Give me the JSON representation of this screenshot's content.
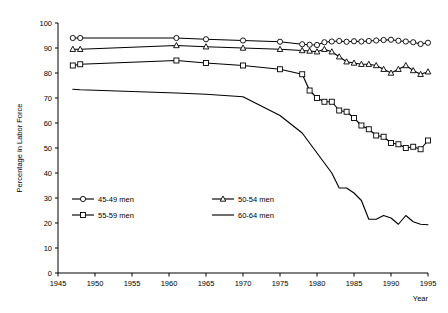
{
  "chart_data": {
    "type": "line",
    "title": "",
    "xlabel": "Year",
    "ylabel": "Percentage in Labor Force",
    "xlim": [
      1945,
      1995
    ],
    "ylim": [
      0,
      100
    ],
    "grid": false,
    "legend_position": "lower-left-inside",
    "xticks": [
      1945,
      1950,
      1955,
      1960,
      1965,
      1970,
      1975,
      1980,
      1985,
      1990,
      1995
    ],
    "yticks": [
      0,
      10,
      20,
      30,
      40,
      50,
      60,
      70,
      80,
      90,
      100
    ],
    "series": [
      {
        "name": "45-49 men",
        "marker": "circle",
        "x": [
          1947,
          1948,
          1961,
          1965,
          1970,
          1975,
          1978,
          1979,
          1980,
          1981,
          1982,
          1983,
          1984,
          1985,
          1986,
          1987,
          1988,
          1989,
          1990,
          1991,
          1992,
          1993,
          1994,
          1995
        ],
        "values": [
          94,
          94,
          94,
          93.5,
          93,
          92.5,
          91.5,
          91.3,
          91.2,
          92.3,
          92.6,
          92.8,
          92.5,
          92.7,
          92.6,
          92.8,
          93,
          93.2,
          93.3,
          92.9,
          92.6,
          92.3,
          91.6,
          92.1
        ]
      },
      {
        "name": "50-54 men",
        "marker": "triangle",
        "x": [
          1947,
          1948,
          1961,
          1965,
          1970,
          1975,
          1978,
          1979,
          1980,
          1981,
          1982,
          1983,
          1984,
          1985,
          1986,
          1987,
          1988,
          1989,
          1990,
          1991,
          1992,
          1993,
          1994,
          1995
        ],
        "values": [
          89.5,
          89.5,
          91,
          90.5,
          90,
          89.5,
          89,
          88.8,
          88.5,
          89.5,
          88.5,
          86.5,
          84.5,
          84,
          83.5,
          83.5,
          83,
          81.5,
          80,
          81.5,
          83,
          81,
          79.5,
          80.5
        ]
      },
      {
        "name": "55-59 men",
        "marker": "square",
        "x": [
          1947,
          1948,
          1961,
          1965,
          1970,
          1975,
          1978,
          1979,
          1980,
          1981,
          1982,
          1983,
          1984,
          1985,
          1986,
          1987,
          1988,
          1989,
          1990,
          1991,
          1992,
          1993,
          1994,
          1995
        ],
        "values": [
          83,
          83.5,
          85,
          84,
          83,
          81.5,
          79.5,
          73,
          70,
          68.5,
          68.5,
          65,
          64.5,
          62,
          59,
          57.5,
          55,
          54.5,
          52,
          51.5,
          50,
          50.5,
          49.5,
          53
        ]
      },
      {
        "name": "60-64 men",
        "marker": "none",
        "x": [
          1947,
          1948,
          1961,
          1965,
          1970,
          1975,
          1978,
          1979,
          1980,
          1981,
          1982,
          1983,
          1984,
          1985,
          1986,
          1987,
          1988,
          1989,
          1990,
          1991,
          1992,
          1993,
          1994,
          1995
        ],
        "values": [
          73.5,
          73.3,
          72,
          71.5,
          70.5,
          63,
          56,
          52,
          48,
          44,
          40,
          34,
          34,
          32,
          29,
          21.5,
          21.5,
          23,
          22,
          19.5,
          23,
          20.5,
          19.5,
          19.3
        ]
      }
    ]
  },
  "legend": {
    "entries": [
      {
        "label": "45-49 men",
        "marker": "circle"
      },
      {
        "label": "50-54 men",
        "marker": "triangle"
      },
      {
        "label": "55-59 men",
        "marker": "square"
      },
      {
        "label": "60-64 men",
        "marker": "none"
      }
    ]
  }
}
